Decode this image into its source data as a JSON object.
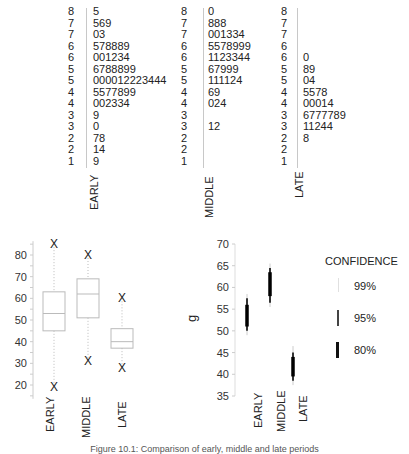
{
  "chart_data": [
    {
      "type": "table",
      "title": "Stem-and-leaf displays",
      "groups": [
        {
          "name": "EARLY",
          "stems": [
            "8",
            "7",
            "7",
            "6",
            "6",
            "5",
            "5",
            "4",
            "4",
            "3",
            "3",
            "2",
            "2",
            "1"
          ],
          "leaves": [
            "5",
            "569",
            "03",
            "578889",
            "001234",
            "6788899",
            "000012223444",
            "5577899",
            "002334",
            "9",
            "0",
            "78",
            "14",
            "9"
          ]
        },
        {
          "name": "MIDDLE",
          "stems": [
            "8",
            "7",
            "7",
            "6",
            "6",
            "5",
            "5",
            "4",
            "4",
            "3",
            "3",
            "2",
            "2",
            "1"
          ],
          "leaves": [
            "0",
            "888",
            "001334",
            "5578999",
            "1123344",
            "67999",
            "111124",
            "69",
            "024",
            "",
            "12",
            "",
            "",
            ""
          ]
        },
        {
          "name": "LATE",
          "stems": [
            "8",
            "7",
            "7",
            "6",
            "6",
            "5",
            "5",
            "4",
            "4",
            "3",
            "3",
            "2",
            "2",
            "1"
          ],
          "leaves": [
            "",
            "",
            "",
            "",
            "0",
            "89",
            "04",
            "5578",
            "00014",
            "6777789",
            "11244",
            "8",
            "",
            ""
          ]
        }
      ]
    },
    {
      "type": "box",
      "title": "Box plots",
      "categories": [
        "EARLY",
        "MIDDLE",
        "LATE"
      ],
      "yticks": [
        20,
        30,
        40,
        50,
        60,
        70,
        80
      ],
      "ylim": [
        15,
        85
      ],
      "series": [
        {
          "name": "EARLY",
          "q1": 45,
          "median": 53,
          "q3": 63,
          "whisker_low": 20,
          "whisker_high": 85,
          "outliers": [
            85,
            19
          ]
        },
        {
          "name": "MIDDLE",
          "q1": 51,
          "median": 62,
          "q3": 69,
          "whisker_low": 31,
          "whisker_high": 80,
          "outliers": [
            80,
            31
          ]
        },
        {
          "name": "LATE",
          "q1": 37,
          "median": 40,
          "q3": 46,
          "whisker_low": 28,
          "whisker_high": 60,
          "outliers": [
            60,
            28
          ]
        }
      ]
    },
    {
      "type": "interval",
      "title": "Confidence intervals for the mean",
      "ylabel": "g",
      "categories": [
        "EARLY",
        "MIDDLE",
        "LATE"
      ],
      "yticks": [
        35,
        40,
        45,
        50,
        55,
        60,
        65,
        70
      ],
      "ylim": [
        35,
        70
      ],
      "legend": {
        "title": "CONFIDENCE",
        "entries": [
          "99%",
          "95%",
          "80%"
        ]
      },
      "series": [
        {
          "name": "EARLY",
          "mean": 53.5,
          "ci99": [
            49,
            58.5
          ],
          "ci95": [
            50,
            57.5
          ],
          "ci80": [
            51,
            56
          ]
        },
        {
          "name": "MIDDLE",
          "mean": 61,
          "ci99": [
            55.5,
            65.5
          ],
          "ci95": [
            56.5,
            64.5
          ],
          "ci80": [
            58,
            63.5
          ]
        },
        {
          "name": "LATE",
          "mean": 42,
          "ci99": [
            37.5,
            46.5
          ],
          "ci95": [
            38.5,
            45
          ],
          "ci80": [
            39.5,
            44
          ]
        }
      ]
    }
  ],
  "labels": {
    "early": "EARLY",
    "middle": "MIDDLE",
    "late": "LATE",
    "ylabel_g": "g",
    "legend_title": "CONFIDENCE",
    "legend_99": "99%",
    "legend_95": "95%",
    "legend_80": "80%"
  },
  "caption": "Figure 10.1: Comparison of early, middle and late periods"
}
